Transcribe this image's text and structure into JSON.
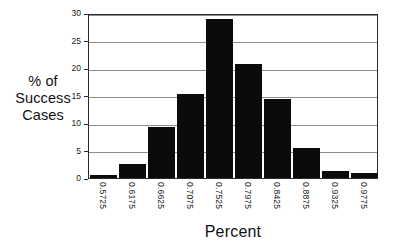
{
  "chart_data": {
    "type": "bar",
    "title": "",
    "subtitle": "",
    "xlabel": "Percent",
    "ylabel": "% of Success Cases",
    "ylabel_lines": [
      "% of",
      "Success",
      "Cases"
    ],
    "categories": [
      "0.5725",
      "0.6175",
      "0.6625",
      "0.7075",
      "0.7525",
      "0.7975",
      "0.8425",
      "0.8875",
      "0.9325",
      "0.9775"
    ],
    "values": [
      0.5,
      2.6,
      9.2,
      15.3,
      29.0,
      20.8,
      14.3,
      5.4,
      1.3,
      1.0
    ],
    "ylim": [
      0,
      30
    ],
    "ytick_labels": [
      "0",
      "5",
      "10",
      "15",
      "20",
      "25",
      "30"
    ],
    "ytick_values": [
      0,
      5,
      10,
      15,
      20,
      25,
      30
    ],
    "grid": "horizontal",
    "legend": "none",
    "bar_color": "#0b0b0b",
    "gridline_color": "#8d8d8d",
    "frame_color": "#2b2b2b",
    "background_color": "#ffffff",
    "xtick_rotation": 90
  }
}
